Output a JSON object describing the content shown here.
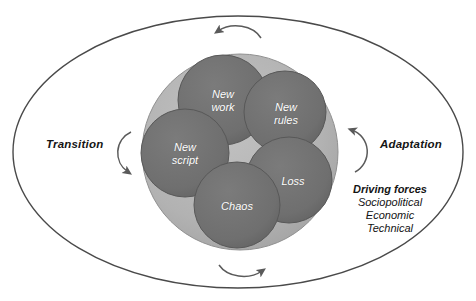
{
  "diagram": {
    "colors": {
      "outline": "#4a4a4a",
      "outer_background": "#ffffff",
      "inner_disc": "#b2b2b2",
      "node_circle": "#6f6f6f",
      "node_text": "#ffffff",
      "label_text": "#141414",
      "arrow": "#5a5a5a"
    },
    "outer_ellipse": {
      "name": "outer-ellipse",
      "cx": 238,
      "cy": 152,
      "rx": 225,
      "ry": 136
    },
    "inner_disc": {
      "name": "inner-disc",
      "cx": 240,
      "cy": 152,
      "r": 98
    },
    "side_labels": [
      {
        "id": "transition",
        "text": "Transition",
        "x": 46,
        "y": 145
      },
      {
        "id": "adaptation",
        "text": "Adaptation",
        "x": 380,
        "y": 145
      }
    ],
    "nodes": [
      {
        "id": "new-work",
        "lines": [
          "New",
          "work"
        ],
        "cx": 223,
        "cy": 100,
        "r": 45
      },
      {
        "id": "new-rules",
        "lines": [
          "New",
          "rules"
        ],
        "cx": 285,
        "cy": 112,
        "r": 41
      },
      {
        "id": "new-script",
        "lines": [
          "New",
          "script"
        ],
        "cx": 185,
        "cy": 153,
        "r": 44
      },
      {
        "id": "loss",
        "lines": [
          "Loss"
        ],
        "cx": 289,
        "cy": 180,
        "r": 43
      },
      {
        "id": "chaos",
        "lines": [
          "Chaos"
        ],
        "cx": 237,
        "cy": 205,
        "r": 43
      }
    ],
    "driving_forces": {
      "title": "Driving forces",
      "items": [
        "Sociopolitical",
        "Economic",
        "Technical"
      ],
      "x": 390,
      "y": 189
    },
    "arrows": [
      {
        "id": "arrow-top",
        "direction": "counterclockwise-left"
      },
      {
        "id": "arrow-bottom",
        "direction": "clockwise-right"
      },
      {
        "id": "arrow-left",
        "direction": "down-right"
      },
      {
        "id": "arrow-right",
        "direction": "up-left"
      }
    ]
  }
}
